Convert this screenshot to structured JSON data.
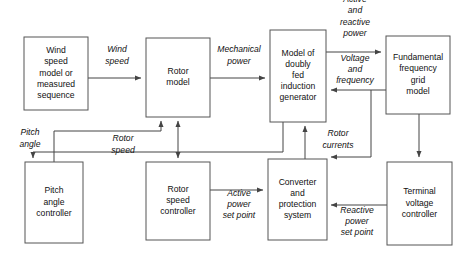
{
  "diagram": {
    "colors": {
      "box_stroke": "#555555",
      "box_fill": "#ffffff",
      "wire": "#444444",
      "text": "#111111",
      "background": "#ffffff"
    },
    "blocks": [
      {
        "id": "wind-speed-model",
        "name": "wind-speed-model-block",
        "lines": [
          "Wind",
          "speed",
          "model or",
          "measured",
          "sequence"
        ],
        "x": 24,
        "y": 37,
        "w": 64,
        "h": 73
      },
      {
        "id": "rotor-model",
        "name": "rotor-model-block",
        "lines": [
          "Rotor",
          "model"
        ],
        "x": 146,
        "y": 38,
        "w": 64,
        "h": 79
      },
      {
        "id": "generator-model",
        "name": "doubly-fed-induction-generator-block",
        "lines": [
          "Model of",
          "doubly",
          "fed",
          "induction",
          "generator"
        ],
        "x": 270,
        "y": 30,
        "w": 56,
        "h": 92
      },
      {
        "id": "grid-model",
        "name": "fundamental-frequency-grid-model-block",
        "lines": [
          "Fundamental",
          "frequency",
          "grid",
          "model"
        ],
        "x": 386,
        "y": 36,
        "w": 64,
        "h": 78
      },
      {
        "id": "pitch-angle-controller",
        "name": "pitch-angle-controller-block",
        "lines": [
          "Pitch",
          "angle",
          "controller"
        ],
        "x": 25,
        "y": 162,
        "w": 58,
        "h": 81
      },
      {
        "id": "rotor-speed-controller",
        "name": "rotor-speed-controller-block",
        "lines": [
          "Rotor",
          "speed",
          "controller"
        ],
        "x": 146,
        "y": 162,
        "w": 64,
        "h": 78
      },
      {
        "id": "converter-protection",
        "name": "converter-and-protection-system-block",
        "lines": [
          "Converter",
          "and",
          "protection",
          "system"
        ],
        "x": 268,
        "y": 159,
        "w": 59,
        "h": 81
      },
      {
        "id": "terminal-voltage-controller",
        "name": "terminal-voltage-controller-block",
        "lines": [
          "Terminal",
          "voltage",
          "controller"
        ],
        "x": 387,
        "y": 162,
        "w": 65,
        "h": 83
      }
    ],
    "signals": [
      {
        "id": "wind-speed",
        "name": "wind-speed-signal-label",
        "lines": [
          "Wind",
          "speed"
        ],
        "x": 117,
        "y": 56
      },
      {
        "id": "mechanical-power",
        "name": "mechanical-power-signal-label",
        "lines": [
          "Mechanical",
          "power"
        ],
        "x": 239,
        "y": 56
      },
      {
        "id": "active-reactive-power",
        "name": "active-and-reactive-power-signal-label",
        "lines": [
          "Active",
          "and",
          "reactive",
          "power"
        ],
        "x": 355,
        "y": 17
      },
      {
        "id": "voltage-frequency",
        "name": "voltage-and-frequency-signal-label",
        "lines": [
          "Voltage",
          "and",
          "frequency"
        ],
        "x": 355,
        "y": 70
      },
      {
        "id": "pitch-angle",
        "name": "pitch-angle-signal-label",
        "lines": [
          "Pitch",
          "angle"
        ],
        "x": 30,
        "y": 139
      },
      {
        "id": "rotor-speed",
        "name": "rotor-speed-signal-label",
        "lines": [
          "Rotor",
          "speed"
        ],
        "x": 123,
        "y": 145
      },
      {
        "id": "rotor-currents",
        "name": "rotor-currents-signal-label",
        "lines": [
          "Rotor",
          "currents"
        ],
        "x": 338,
        "y": 140
      },
      {
        "id": "active-power-setpoint",
        "name": "active-power-set-point-signal-label",
        "lines": [
          "Active",
          "power",
          "set point"
        ],
        "x": 239,
        "y": 205
      },
      {
        "id": "reactive-power-setpoint",
        "name": "reactive-power-set-point-signal-label",
        "lines": [
          "Reactive",
          "power",
          "set point"
        ],
        "x": 357,
        "y": 222
      }
    ]
  }
}
